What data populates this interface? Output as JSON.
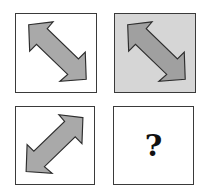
{
  "puzzle": {
    "cells": [
      {
        "position": "top-left",
        "content": "arrow",
        "arrow_direction": "diagonal-down-right (↖↘)",
        "background_color": "#ffffff",
        "arrow_color": "#a9a9a9"
      },
      {
        "position": "top-right",
        "content": "arrow",
        "arrow_direction": "diagonal-down-right (↖↘)",
        "background_color": "#d6d6d6",
        "arrow_color": "#a0a0a0"
      },
      {
        "position": "bottom-left",
        "content": "arrow",
        "arrow_direction": "diagonal-up-right (↙↗)",
        "background_color": "#ffffff",
        "arrow_color": "#a9a9a9"
      },
      {
        "position": "bottom-right",
        "content": "question",
        "label": "?",
        "background_color": "#ffffff"
      }
    ],
    "colors": {
      "border": "#3a3a3a",
      "arrow_outline": "#2e2e2e"
    }
  }
}
